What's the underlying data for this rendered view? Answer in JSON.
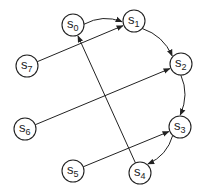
{
  "diagram": {
    "type": "directed-graph",
    "nodes": [
      {
        "id": "s0",
        "label": "s",
        "sub": "0",
        "x": 73,
        "y": 25
      },
      {
        "id": "s1",
        "label": "s",
        "sub": "1",
        "x": 134,
        "y": 21
      },
      {
        "id": "s2",
        "label": "s",
        "sub": "2",
        "x": 181,
        "y": 64
      },
      {
        "id": "s3",
        "label": "s",
        "sub": "3",
        "x": 180,
        "y": 127
      },
      {
        "id": "s4",
        "label": "s",
        "sub": "4",
        "x": 140,
        "y": 173
      },
      {
        "id": "s5",
        "label": "s",
        "sub": "5",
        "x": 73,
        "y": 171
      },
      {
        "id": "s6",
        "label": "s",
        "sub": "6",
        "x": 25,
        "y": 129
      },
      {
        "id": "s7",
        "label": "s",
        "sub": "7",
        "x": 27,
        "y": 66
      }
    ],
    "edges": [
      {
        "from": "s0",
        "to": "s1",
        "curved": true
      },
      {
        "from": "s1",
        "to": "s2",
        "curved": true
      },
      {
        "from": "s2",
        "to": "s3",
        "curved": true
      },
      {
        "from": "s3",
        "to": "s4",
        "curved": true
      },
      {
        "from": "s7",
        "to": "s1",
        "curved": false
      },
      {
        "from": "s6",
        "to": "s2",
        "curved": false
      },
      {
        "from": "s5",
        "to": "s3",
        "curved": false
      },
      {
        "from": "s4",
        "to": "s0",
        "curved": false
      }
    ]
  }
}
